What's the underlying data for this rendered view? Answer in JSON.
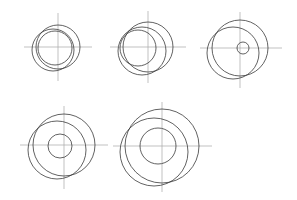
{
  "canvas": {
    "width": 297,
    "height": 200,
    "background": "#ffffff",
    "title": "Eccentric circle construction sequence"
  },
  "style": {
    "circle_stroke": "#3a3a3a",
    "circle_stroke_width": 0.8,
    "axis_stroke": "#a8a8a8",
    "axis_stroke_width": 0.7
  },
  "chart_data": {
    "type": "diagram",
    "panel_count": 5,
    "rows": [
      3,
      2
    ],
    "figures": [
      {
        "id": "figure-1",
        "label": "Step 1",
        "position": "top-left",
        "center": {
          "x": 58,
          "y": 47
        },
        "axes": {
          "horizontal": {
            "x1": 24,
            "x2": 92,
            "y": 47
          },
          "vertical": {
            "y1": 13,
            "y2": 81,
            "x": 58
          }
        },
        "circles": [
          {
            "name": "outer-circle",
            "cx": 58,
            "cy": 47,
            "r": 22
          },
          {
            "name": "offset-circle",
            "cx": 53,
            "cy": 50,
            "r": 21
          },
          {
            "name": "inner-circle",
            "cx": 55,
            "cy": 48,
            "r": 17
          }
        ]
      },
      {
        "id": "figure-2",
        "label": "Step 2",
        "position": "top-center",
        "center": {
          "x": 148,
          "y": 47
        },
        "axes": {
          "horizontal": {
            "x1": 110,
            "x2": 186,
            "y": 47
          },
          "vertical": {
            "y1": 11,
            "y2": 83,
            "x": 148
          }
        },
        "circles": [
          {
            "name": "outer-circle",
            "cx": 148,
            "cy": 47,
            "r": 25
          },
          {
            "name": "offset-circle",
            "cx": 142,
            "cy": 51,
            "r": 24
          },
          {
            "name": "inner-circle",
            "cx": 138,
            "cy": 48,
            "r": 18
          }
        ]
      },
      {
        "id": "figure-3",
        "label": "Step 3",
        "position": "top-right",
        "center": {
          "x": 240,
          "y": 48
        },
        "axes": {
          "horizontal": {
            "x1": 200,
            "x2": 282,
            "y": 48
          },
          "vertical": {
            "y1": 12,
            "y2": 88,
            "x": 240
          }
        },
        "circles": [
          {
            "name": "outer-circle",
            "cx": 240,
            "cy": 48,
            "r": 28
          },
          {
            "name": "offset-circle",
            "cx": 233,
            "cy": 53,
            "r": 26
          },
          {
            "name": "inner-circle",
            "cx": 243,
            "cy": 48,
            "r": 6
          }
        ]
      },
      {
        "id": "figure-4",
        "label": "Step 4",
        "position": "bottom-left",
        "center": {
          "x": 64,
          "y": 145
        },
        "axes": {
          "horizontal": {
            "x1": 20,
            "x2": 108,
            "y": 145
          },
          "vertical": {
            "y1": 106,
            "y2": 189,
            "x": 64
          }
        },
        "circles": [
          {
            "name": "outer-circle",
            "cx": 64,
            "cy": 145,
            "r": 31
          },
          {
            "name": "offset-circle",
            "cx": 57,
            "cy": 150,
            "r": 29
          },
          {
            "name": "inner-circle",
            "cx": 60,
            "cy": 146,
            "r": 12
          }
        ]
      },
      {
        "id": "figure-5",
        "label": "Step 5",
        "position": "bottom-center",
        "center": {
          "x": 162,
          "y": 146
        },
        "axes": {
          "horizontal": {
            "x1": 113,
            "x2": 212,
            "y": 146
          },
          "vertical": {
            "y1": 102,
            "y2": 192,
            "x": 162
          }
        },
        "circles": [
          {
            "name": "outer-circle",
            "cx": 162,
            "cy": 146,
            "r": 37
          },
          {
            "name": "offset-circle",
            "cx": 154,
            "cy": 152,
            "r": 34
          },
          {
            "name": "inner-circle",
            "cx": 158,
            "cy": 146,
            "r": 18
          }
        ]
      }
    ]
  }
}
